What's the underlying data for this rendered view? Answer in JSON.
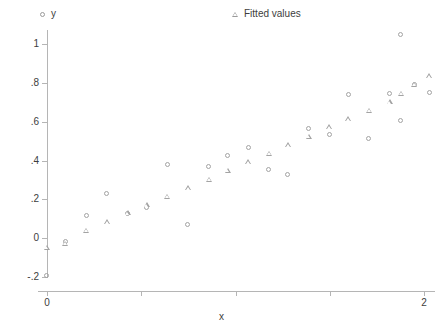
{
  "chart_data": {
    "type": "scatter",
    "title": "",
    "xlabel": "x",
    "ylabel": "",
    "xlim": [
      -0.07,
      2.1
    ],
    "ylim": [
      -0.23,
      1.1
    ],
    "grid": false,
    "legend_position": "top",
    "x_ticks": [
      {
        "value": 0,
        "label": "0"
      },
      {
        "value": 0.5,
        "label": ""
      },
      {
        "value": 1.0,
        "label": ""
      },
      {
        "value": 1.5,
        "label": ""
      },
      {
        "value": 2,
        "label": "2"
      }
    ],
    "y_ticks": [
      {
        "value": 1,
        "label": "1"
      },
      {
        "value": 0.8,
        "label": ".8"
      },
      {
        "value": 0.6,
        "label": ".6"
      },
      {
        "value": 0.4,
        "label": ".4"
      },
      {
        "value": 0.2,
        "label": ".2"
      },
      {
        "value": 0,
        "label": "0"
      },
      {
        "value": -0.2,
        "label": "-.2"
      }
    ],
    "series": [
      {
        "name": "y",
        "marker": "circle",
        "color": "#a3a3a3",
        "points": [
          {
            "x": 0.0,
            "y": -0.195
          },
          {
            "x": 0.1,
            "y": -0.02
          },
          {
            "x": 0.21,
            "y": 0.113
          },
          {
            "x": 0.32,
            "y": 0.226
          },
          {
            "x": 0.43,
            "y": 0.123
          },
          {
            "x": 0.53,
            "y": 0.156
          },
          {
            "x": 0.64,
            "y": 0.378
          },
          {
            "x": 0.75,
            "y": 0.068
          },
          {
            "x": 0.86,
            "y": 0.368
          },
          {
            "x": 0.96,
            "y": 0.424
          },
          {
            "x": 1.07,
            "y": 0.465
          },
          {
            "x": 1.18,
            "y": 0.353
          },
          {
            "x": 1.28,
            "y": 0.327
          },
          {
            "x": 1.39,
            "y": 0.562
          },
          {
            "x": 1.5,
            "y": 0.531
          },
          {
            "x": 1.6,
            "y": 0.735
          },
          {
            "x": 1.71,
            "y": 0.51
          },
          {
            "x": 1.82,
            "y": 0.74
          },
          {
            "x": 1.88,
            "y": 0.606
          },
          {
            "x": 1.95,
            "y": 0.79
          },
          {
            "x": 2.03,
            "y": 0.75
          }
        ]
      },
      {
        "name": "Fitted values",
        "marker": "triangle",
        "color": "#a3a3a3",
        "points": [
          {
            "x": 0.0,
            "y": -0.05
          },
          {
            "x": 0.1,
            "y": -0.03
          },
          {
            "x": 0.21,
            "y": 0.038
          },
          {
            "x": 0.32,
            "y": 0.082
          },
          {
            "x": 0.43,
            "y": 0.128
          },
          {
            "x": 0.53,
            "y": 0.17
          },
          {
            "x": 0.64,
            "y": 0.214
          },
          {
            "x": 0.75,
            "y": 0.257
          },
          {
            "x": 0.86,
            "y": 0.3
          },
          {
            "x": 0.96,
            "y": 0.347
          },
          {
            "x": 1.07,
            "y": 0.39
          },
          {
            "x": 1.18,
            "y": 0.435
          },
          {
            "x": 1.28,
            "y": 0.478
          },
          {
            "x": 1.39,
            "y": 0.522
          },
          {
            "x": 1.5,
            "y": 0.57
          },
          {
            "x": 1.6,
            "y": 0.612
          },
          {
            "x": 1.71,
            "y": 0.655
          },
          {
            "x": 1.82,
            "y": 0.7
          },
          {
            "x": 1.88,
            "y": 0.745
          },
          {
            "x": 1.95,
            "y": 0.79
          },
          {
            "x": 2.03,
            "y": 0.833
          }
        ]
      }
    ],
    "outliers": [
      {
        "series": "y",
        "x": 1.88,
        "y": 1.045
      }
    ]
  },
  "legend": {
    "entries": [
      {
        "label": "y",
        "marker": "circle-marker-icon"
      },
      {
        "label": "Fitted values",
        "marker": "triangle-marker-icon"
      }
    ]
  },
  "axes": {
    "x_title": "x",
    "y_title": ""
  }
}
